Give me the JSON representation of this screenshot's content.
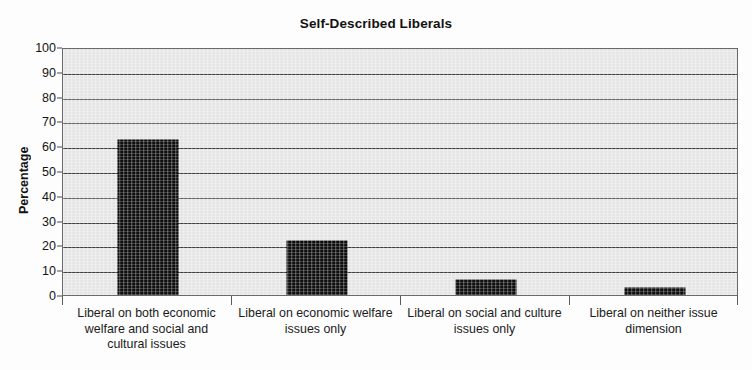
{
  "chart_data": {
    "type": "bar",
    "title": "Self-Described Liberals",
    "xlabel": "",
    "ylabel": "Percentage",
    "ylim": [
      0,
      100
    ],
    "ytick_step": 10,
    "yticks": [
      0,
      10,
      20,
      30,
      40,
      50,
      60,
      70,
      80,
      90,
      100
    ],
    "grid": true,
    "legend": "none",
    "categories": [
      "Liberal on both economic welfare and social and cultural issues",
      "Liberal on economic welfare issues only",
      "Liberal on social and culture issues only",
      "Liberal on neither issue dimension"
    ],
    "values": [
      63.5,
      22.5,
      7,
      3.5
    ],
    "series": [
      {
        "name": "Percentage",
        "values": [
          63.5,
          22.5,
          7,
          3.5
        ]
      }
    ],
    "colors": {
      "bar": "#0d0d0d",
      "plot_background": "#e9e9e9",
      "gridline": "#3d3d3d",
      "axis": "#6a6a6a",
      "text": "#1a1a1a",
      "page_background": "#ffffff"
    }
  }
}
